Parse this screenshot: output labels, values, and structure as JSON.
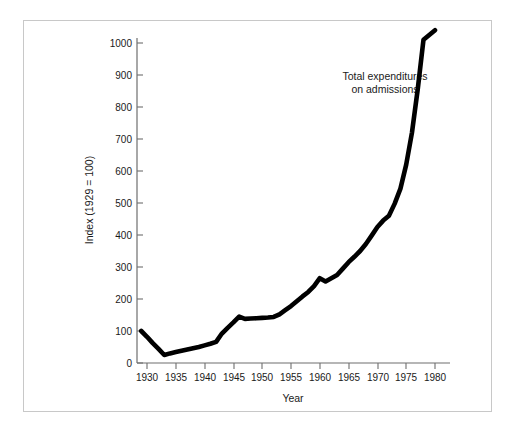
{
  "figure": {
    "background_color": "#ffffff",
    "frame_color": "#c8c8c8",
    "line_color": "#000000",
    "text_color": "#1a1a1a"
  },
  "annotation": {
    "line1": "Total expenditures",
    "line2": "on admissions"
  },
  "axes": {
    "x_title": "Year",
    "y_title": "Index (1929 = 100)"
  },
  "chart_data": {
    "type": "line",
    "title": "",
    "subtitle": "",
    "xlabel": "Year",
    "ylabel": "Index (1929 = 100)",
    "xlim": [
      1928.5,
      1981.5
    ],
    "ylim": [
      0,
      1060
    ],
    "grid": false,
    "legend": "none",
    "annotations": [
      {
        "text": "Total expenditures on admissions",
        "x": 1967,
        "y": 880
      }
    ],
    "x_ticks": [
      1930,
      1935,
      1940,
      1945,
      1950,
      1955,
      1960,
      1965,
      1970,
      1975,
      1980
    ],
    "x_tick_labels": [
      "1930",
      "1935",
      "1940",
      "1945",
      "1950",
      "1955",
      "1960",
      "1965",
      "1970",
      "1975",
      "1980"
    ],
    "y_ticks": [
      0,
      100,
      200,
      300,
      400,
      500,
      600,
      700,
      800,
      900,
      1000
    ],
    "y_tick_labels": [
      "0",
      "100",
      "200",
      "300",
      "400",
      "500",
      "600",
      "700",
      "800",
      "900",
      "1000"
    ],
    "series": [
      {
        "name": "Total expenditures on admissions",
        "color": "#000000",
        "x": [
          1929,
          1930,
          1931,
          1932,
          1933,
          1934,
          1935,
          1936,
          1937,
          1938,
          1939,
          1940,
          1941,
          1942,
          1943,
          1944,
          1945,
          1946,
          1947,
          1948,
          1949,
          1950,
          1951,
          1952,
          1953,
          1954,
          1955,
          1956,
          1957,
          1958,
          1959,
          1960,
          1961,
          1962,
          1963,
          1964,
          1965,
          1966,
          1967,
          1968,
          1969,
          1970,
          1971,
          1972,
          1973,
          1974,
          1975,
          1976,
          1977,
          1978,
          1979,
          1980
        ],
        "values": [
          100,
          82,
          62,
          44,
          25,
          30,
          34,
          38,
          42,
          46,
          50,
          55,
          60,
          66,
          92,
          110,
          127,
          145,
          138,
          139,
          140,
          141,
          142,
          144,
          152,
          165,
          178,
          193,
          208,
          222,
          240,
          265,
          255,
          265,
          275,
          295,
          315,
          332,
          350,
          372,
          398,
          425,
          445,
          460,
          498,
          545,
          620,
          720,
          855,
          1010,
          1025,
          1040
        ]
      }
    ]
  }
}
